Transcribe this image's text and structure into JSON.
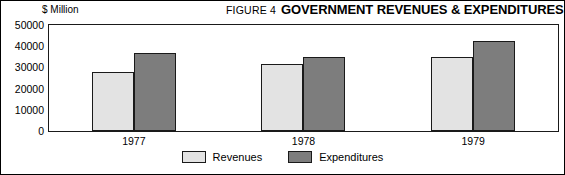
{
  "figure": {
    "number_label": "FIGURE 4",
    "title": "GOVERNMENT REVENUES & EXPENDITURES",
    "unit_label": "$ Million"
  },
  "legend": {
    "items": [
      {
        "label": "Revenues",
        "color": "#e3e3e3"
      },
      {
        "label": "Expenditures",
        "color": "#7d7d7d"
      }
    ]
  },
  "chart_data": {
    "type": "bar",
    "title": "GOVERNMENT REVENUES & EXPENDITURES",
    "subtitle": "FIGURE 4",
    "xlabel": "",
    "ylabel": "$ Million",
    "categories": [
      "1977",
      "1978",
      "1979"
    ],
    "series": [
      {
        "name": "Revenues",
        "color": "#e3e3e3",
        "values": [
          27800,
          31800,
          35000
        ]
      },
      {
        "name": "Expenditures",
        "color": "#7d7d7d",
        "values": [
          36800,
          34800,
          42300
        ]
      }
    ],
    "ylim": [
      0,
      50000
    ],
    "yticks": [
      0,
      10000,
      20000,
      30000,
      40000,
      50000
    ],
    "ytick_labels": [
      "0",
      "10000",
      "20000",
      "30000",
      "40000",
      "50000"
    ],
    "grid": false,
    "legend_position": "bottom-center"
  }
}
